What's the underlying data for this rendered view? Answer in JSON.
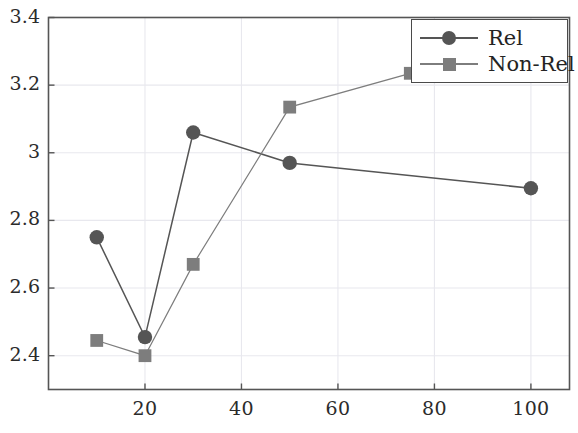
{
  "chart_data": {
    "type": "line",
    "title": "",
    "xlabel": "",
    "ylabel": "",
    "xlim": [
      0,
      108
    ],
    "ylim": [
      2.3,
      3.4
    ],
    "xticks": [
      20,
      40,
      60,
      80,
      100
    ],
    "yticks": [
      2.4,
      2.6,
      2.8,
      3,
      3.2,
      3.4
    ],
    "xtick_labels": [
      "20",
      "40",
      "60",
      "80",
      "100"
    ],
    "ytick_labels": [
      "2.4",
      "2.6",
      "2.8",
      "3",
      "3.2",
      "3.4"
    ],
    "grid": true,
    "legend_position": "top-right",
    "series": [
      {
        "name": "Rel",
        "marker": "circle",
        "color": "#555555",
        "x": [
          10,
          20,
          30,
          50,
          100
        ],
        "values": [
          2.75,
          2.455,
          3.06,
          2.97,
          2.895
        ]
      },
      {
        "name": "Non-Rel",
        "marker": "square",
        "color": "#7d7d7d",
        "x": [
          10,
          20,
          30,
          50,
          75
        ],
        "values": [
          2.445,
          2.4,
          2.67,
          3.135,
          3.235
        ]
      }
    ]
  },
  "legend": {
    "entries": [
      {
        "label": "Rel",
        "marker": "circle-marker",
        "color": "#555555"
      },
      {
        "label": "Non-Rel",
        "marker": "square-marker",
        "color": "#7d7d7d"
      }
    ]
  },
  "axes": {
    "y_labels": [
      "3.4",
      "3.2",
      "3",
      "2.8",
      "2.6",
      "2.4"
    ],
    "x_labels": [
      "20",
      "40",
      "60",
      "80",
      "100"
    ]
  },
  "colors": {
    "rel": "#555555",
    "non_rel": "#7d7d7d",
    "axis": "#555555",
    "grid": "#e8e8ee",
    "text": "#2b2b2b"
  }
}
